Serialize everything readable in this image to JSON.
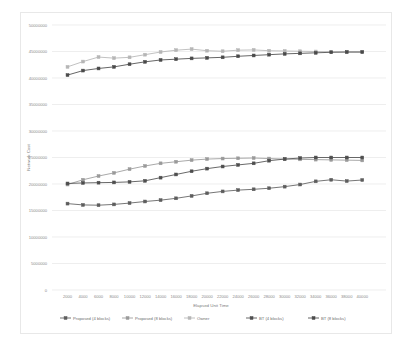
{
  "chart_data": {
    "type": "line",
    "title": "",
    "xlabel": "Elapsed  Unit Time",
    "ylabel": "Network Cost",
    "xlim": [
      0,
      41000
    ],
    "ylim": [
      0,
      50000000
    ],
    "grid": true,
    "legend_position": "bottom",
    "x": [
      2000,
      4000,
      6000,
      8000,
      10000,
      12000,
      14000,
      16000,
      18000,
      20000,
      22000,
      24000,
      26000,
      28000,
      30000,
      32000,
      34000,
      36000,
      38000,
      40000
    ],
    "xtick_labels": [
      "2000",
      "4000",
      "6000",
      "8000",
      "10000",
      "12000",
      "14000",
      "16000",
      "18000",
      "20000",
      "22000",
      "24000",
      "26000",
      "28000",
      "30000",
      "32000",
      "34000",
      "36000",
      "38000",
      "40000"
    ],
    "ytick_labels": [
      "0",
      "5000000",
      "10000000",
      "15000000",
      "20000000",
      "25000000",
      "30000000",
      "35000000",
      "40000000",
      "45000000",
      "50000000"
    ],
    "ytick_values": [
      0,
      5000000,
      10000000,
      15000000,
      20000000,
      25000000,
      30000000,
      35000000,
      40000000,
      45000000,
      50000000
    ],
    "series": [
      {
        "name": "Proposed (4 blocks)",
        "color": "#5d5d5d",
        "marker": "square",
        "values": [
          16300000,
          16050000,
          16000000,
          16150000,
          16400000,
          16700000,
          16950000,
          17300000,
          17750000,
          18250000,
          18600000,
          18850000,
          19000000,
          19200000,
          19500000,
          19900000,
          20500000,
          20800000,
          20550000,
          20750000
        ]
      },
      {
        "name": "Proposed (8 blocks)",
        "color": "#9a9a9a",
        "marker": "square",
        "values": [
          19900000,
          20800000,
          21500000,
          22100000,
          22800000,
          23400000,
          23900000,
          24200000,
          24500000,
          24700000,
          24800000,
          24850000,
          24900000,
          24800000,
          24700000,
          24650000,
          24600000,
          24550000,
          24500000,
          24450000
        ]
      },
      {
        "name": "Owner",
        "color": "#b6b6b6",
        "marker": "square",
        "values": [
          42100000,
          43100000,
          43950000,
          43750000,
          43900000,
          44400000,
          44900000,
          45250000,
          45450000,
          45150000,
          45050000,
          45250000,
          45300000,
          45150000,
          45100000,
          45050000,
          45000000,
          44950000,
          44900000,
          44900000
        ]
      },
      {
        "name": "BT (4 blocks)",
        "color": "#4e4e4e",
        "marker": "square",
        "values": [
          20100000,
          20200000,
          20250000,
          20300000,
          20400000,
          20600000,
          21200000,
          21800000,
          22400000,
          22900000,
          23300000,
          23600000,
          23900000,
          24400000,
          24700000,
          24900000,
          25000000,
          25000000,
          25000000,
          25000000
        ]
      },
      {
        "name": "BT (8 blocks)",
        "color": "#4a4a4a",
        "marker": "square",
        "values": [
          40550000,
          41400000,
          41800000,
          42100000,
          42600000,
          43050000,
          43400000,
          43550000,
          43700000,
          43800000,
          43900000,
          44100000,
          44250000,
          44400000,
          44550000,
          44650000,
          44750000,
          44850000,
          44900000,
          44900000
        ]
      }
    ]
  },
  "legend": {
    "items": [
      {
        "label": "Proposed (4 blocks)",
        "color": "#5d5d5d"
      },
      {
        "label": "Proposed (8 blocks)",
        "color": "#9a9a9a"
      },
      {
        "label": "Owner",
        "color": "#b6b6b6"
      },
      {
        "label": "BT (4 blocks)",
        "color": "#4e4e4e"
      },
      {
        "label": "BT (8 blocks)",
        "color": "#4a4a4a"
      }
    ]
  }
}
